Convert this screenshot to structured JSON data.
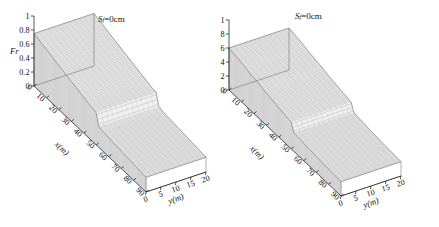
{
  "figure": {
    "background": "#ffffff",
    "mesh_color": "#9a9a9a",
    "axis_color": "#111111"
  },
  "panels": [
    {
      "id": "left",
      "annotation_symbol": "S",
      "annotation_subscript": "f",
      "annotation_value": "=0cm",
      "annotation_full": "Sf=0cm",
      "z_label": "Fr",
      "z_ticks": [
        "0",
        "0.2",
        "0.4",
        "0.6",
        "0.8",
        "1"
      ],
      "x_label": "x(m)",
      "x_ticks": [
        "0",
        "10",
        "20",
        "30",
        "40",
        "50",
        "60",
        "70",
        "80",
        "90"
      ],
      "y_label": "y(m)",
      "y_ticks": [
        "0",
        "5",
        "10",
        "15",
        "20"
      ]
    },
    {
      "id": "right",
      "annotation_symbol": "S",
      "annotation_subscript": "f",
      "annotation_value": "=0cm",
      "annotation_full": "Sf=0cm",
      "z_label": "Fr",
      "z_ticks": [
        "0",
        "0.2",
        "0.4",
        "0.6",
        "0.8",
        "1"
      ],
      "x_label": "x(m)",
      "x_ticks": [
        "0",
        "10",
        "20",
        "30",
        "40",
        "50",
        "60",
        "70",
        "80",
        "90"
      ],
      "y_label": "y(m)",
      "y_ticks": [
        "0",
        "5",
        "10",
        "15",
        "20"
      ]
    }
  ],
  "chart_data": [
    {
      "type": "area",
      "title": "Sf=0cm",
      "subtitle": "",
      "xlabel": "x(m)",
      "ylabel": "y(m)",
      "zlabel": "Fr",
      "xlim": [
        0,
        90
      ],
      "ylim": [
        0,
        20
      ],
      "zlim": [
        0,
        1
      ],
      "xticks": [
        0,
        10,
        20,
        30,
        40,
        50,
        60,
        70,
        80,
        90
      ],
      "yticks": [
        0,
        5,
        10,
        15,
        20
      ],
      "zticks": [
        0,
        0.2,
        0.4,
        0.6,
        0.8,
        1
      ],
      "grid": false,
      "legend": "none",
      "projection": "3d-surface-mesh",
      "x": [
        0,
        5,
        10,
        15,
        20,
        25,
        30,
        35,
        40,
        45,
        50,
        52,
        55,
        60,
        65,
        70,
        75,
        80,
        85,
        90
      ],
      "series": [
        {
          "name": "Fr along channel (uniform across y)",
          "values": [
            0.75,
            0.72,
            0.69,
            0.66,
            0.63,
            0.6,
            0.57,
            0.54,
            0.51,
            0.48,
            0.46,
            0.3,
            0.28,
            0.27,
            0.26,
            0.25,
            0.24,
            0.23,
            0.22,
            0.21
          ]
        }
      ],
      "annotations": [
        {
          "text": "Sf=0cm",
          "x": 45,
          "z": 0.95
        },
        {
          "text": "hydraulic jump / step drop",
          "x": 51,
          "z": 0.46
        }
      ]
    },
    {
      "type": "area",
      "title": "Sf=0cm",
      "subtitle": "",
      "xlabel": "x(m)",
      "ylabel": "y(m)",
      "zlabel": "Fr",
      "xlim": [
        0,
        90
      ],
      "ylim": [
        0,
        20
      ],
      "zlim": [
        0,
        1
      ],
      "xticks": [
        0,
        10,
        20,
        30,
        40,
        50,
        60,
        70,
        80,
        90
      ],
      "yticks": [
        0,
        5,
        10,
        15,
        20
      ],
      "zticks": [
        0,
        0.2,
        0.4,
        0.6,
        0.8,
        1
      ],
      "grid": false,
      "legend": "none",
      "projection": "3d-surface-mesh",
      "x": [
        0,
        5,
        10,
        15,
        20,
        25,
        30,
        35,
        40,
        45,
        50,
        52,
        55,
        60,
        65,
        70,
        75,
        80,
        85,
        90
      ],
      "series": [
        {
          "name": "Fr along channel (uniform across y)",
          "values": [
            0.6,
            0.58,
            0.56,
            0.53,
            0.51,
            0.49,
            0.46,
            0.44,
            0.42,
            0.4,
            0.38,
            0.27,
            0.26,
            0.25,
            0.24,
            0.23,
            0.22,
            0.215,
            0.21,
            0.205
          ]
        }
      ],
      "annotations": [
        {
          "text": "Sf=0cm",
          "x": 45,
          "z": 0.95
        },
        {
          "text": "hydraulic jump / step drop",
          "x": 51,
          "z": 0.38
        }
      ]
    }
  ]
}
